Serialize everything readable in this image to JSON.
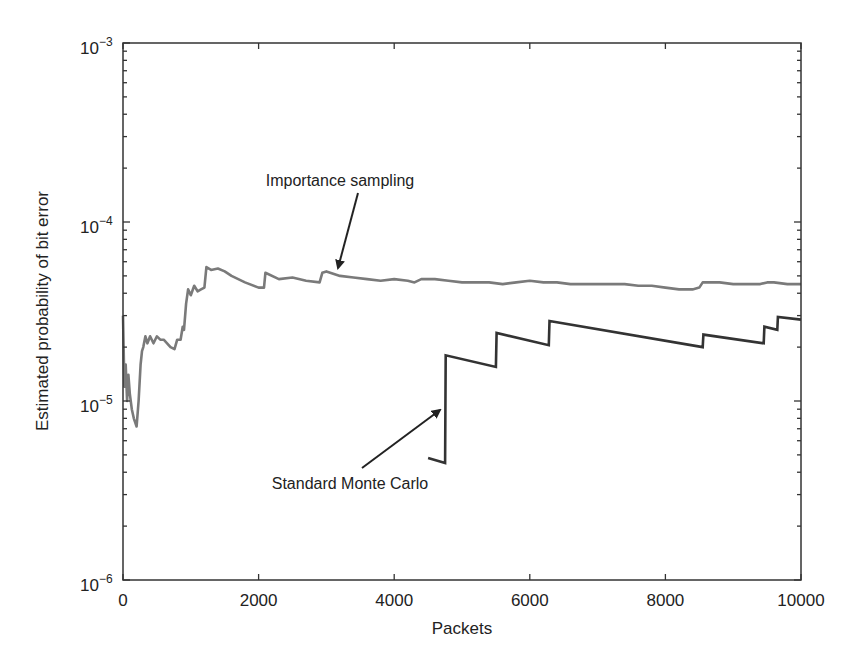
{
  "chart_data": {
    "type": "line",
    "title": "",
    "xlabel": "Packets",
    "ylabel": "Estimated probability of bit error",
    "xlim": [
      0,
      10000
    ],
    "ylim": [
      1e-06,
      0.001
    ],
    "yscale": "log",
    "grid": false,
    "legend": null,
    "x_ticks": [
      0,
      2000,
      4000,
      6000,
      8000,
      10000
    ],
    "x_tick_labels": [
      "0",
      "2000",
      "4000",
      "6000",
      "8000",
      "10000"
    ],
    "y_ticks": [
      0.001,
      0.0001,
      1e-05,
      1e-06
    ],
    "y_tick_labels": [
      {
        "base": "10",
        "exp": "−3"
      },
      {
        "base": "10",
        "exp": "−4"
      },
      {
        "base": "10",
        "exp": "−5"
      },
      {
        "base": "10",
        "exp": "−6"
      }
    ],
    "series": [
      {
        "name": "Importance sampling",
        "color": "#7a7a7a",
        "x": [
          0,
          20,
          40,
          60,
          80,
          100,
          130,
          160,
          200,
          230,
          260,
          280,
          300,
          330,
          360,
          400,
          450,
          500,
          550,
          600,
          650,
          700,
          760,
          800,
          850,
          880,
          900,
          930,
          960,
          1000,
          1050,
          1100,
          1150,
          1200,
          1230,
          1300,
          1400,
          1500,
          1600,
          1800,
          2000,
          2080,
          2100,
          2300,
          2500,
          2700,
          2900,
          2940,
          3000,
          3200,
          3400,
          3600,
          3800,
          4000,
          4200,
          4300,
          4400,
          4600,
          4800,
          5000,
          5200,
          5400,
          5600,
          5800,
          6000,
          6200,
          6400,
          6600,
          6800,
          7000,
          7200,
          7400,
          7600,
          7800,
          8000,
          8200,
          8400,
          8500,
          8550,
          8800,
          9000,
          9200,
          9400,
          9500,
          9600,
          9800,
          10000
        ],
        "values": [
          3e-05,
          1.2e-05,
          1.6e-05,
          1e-05,
          1.4e-05,
          1.1e-05,
          9e-06,
          8e-06,
          7.2e-06,
          1e-05,
          1.6e-05,
          1.9e-05,
          2e-05,
          2.3e-05,
          2.1e-05,
          2.3e-05,
          2.1e-05,
          2.3e-05,
          2.2e-05,
          2.2e-05,
          2.1e-05,
          2e-05,
          1.95e-05,
          2.2e-05,
          2.2e-05,
          2.6e-05,
          2.5e-05,
          3.5e-05,
          4.2e-05,
          3.9e-05,
          4.4e-05,
          4.1e-05,
          4.2e-05,
          4.3e-05,
          5.6e-05,
          5.4e-05,
          5.5e-05,
          5.3e-05,
          5e-05,
          4.6e-05,
          4.3e-05,
          4.3e-05,
          5.2e-05,
          4.8e-05,
          4.9e-05,
          4.7e-05,
          4.6e-05,
          5.2e-05,
          5.3e-05,
          5e-05,
          4.9e-05,
          4.8e-05,
          4.7e-05,
          4.8e-05,
          4.7e-05,
          4.6e-05,
          4.8e-05,
          4.8e-05,
          4.7e-05,
          4.6e-05,
          4.6e-05,
          4.6e-05,
          4.5e-05,
          4.6e-05,
          4.7e-05,
          4.6e-05,
          4.6e-05,
          4.5e-05,
          4.5e-05,
          4.5e-05,
          4.5e-05,
          4.5e-05,
          4.4e-05,
          4.4e-05,
          4.3e-05,
          4.2e-05,
          4.2e-05,
          4.3e-05,
          4.6e-05,
          4.6e-05,
          4.5e-05,
          4.5e-05,
          4.5e-05,
          4.6e-05,
          4.6e-05,
          4.5e-05,
          4.5e-05
        ]
      },
      {
        "name": "Standard Monte Carlo",
        "color": "#333333",
        "x": [
          4500,
          4750,
          4760,
          5500,
          5510,
          6280,
          6290,
          8550,
          8560,
          9450,
          9460,
          9650,
          9660,
          10000
        ],
        "values": [
          4.8e-06,
          4.5e-06,
          1.8e-05,
          1.55e-05,
          2.4e-05,
          2.05e-05,
          2.8e-05,
          2e-05,
          2.35e-05,
          2.1e-05,
          2.6e-05,
          2.5e-05,
          2.95e-05,
          2.85e-05
        ]
      }
    ],
    "annotations": [
      {
        "text": "Importance sampling",
        "text_x": 340,
        "text_y": 186,
        "arrow_from": [
          358,
          193
        ],
        "arrow_to": [
          338,
          268
        ]
      },
      {
        "text": "Standard Monte Carlo",
        "text_x": 350,
        "text_y": 489,
        "arrow_from": [
          362,
          468
        ],
        "arrow_to": [
          440,
          410
        ]
      }
    ]
  }
}
